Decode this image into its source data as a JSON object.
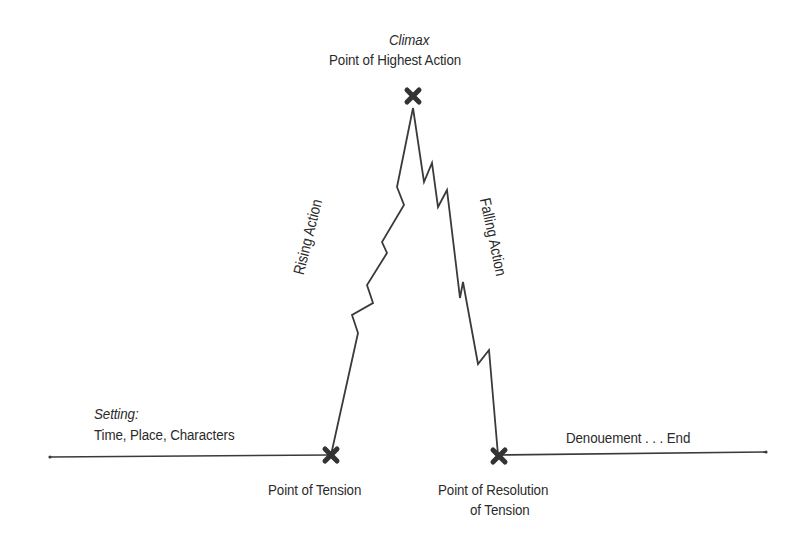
{
  "diagram": {
    "type": "plot-structure-pyramid",
    "climax": {
      "title": "Climax",
      "subtitle": "Point of Highest Action"
    },
    "rising_action": {
      "label": "Rising Action"
    },
    "falling_action": {
      "label": "Falling Action"
    },
    "setting": {
      "title": "Setting:",
      "subtitle": "Time, Place, Characters"
    },
    "point_of_tension": {
      "label": "Point of Tension"
    },
    "point_of_resolution": {
      "line1": "Point of Resolution",
      "line2": "of Tension"
    },
    "denouement": {
      "label": "Denouement . . . End"
    },
    "colors": {
      "line": "#3a3a3a",
      "marker": "#333333",
      "text": "#2a2a2a",
      "background": "#ffffff"
    }
  }
}
